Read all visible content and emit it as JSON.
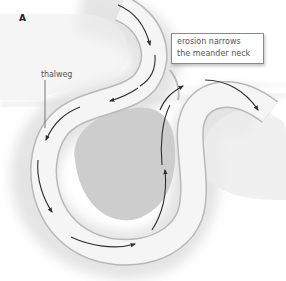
{
  "figure": {
    "panel_label": "A",
    "labels": {
      "thalweg": "thalweg"
    },
    "callout": {
      "line1": "erosion narrows",
      "line2": "the meander neck"
    },
    "colors": {
      "background": "#ffffff",
      "river_channel": "#f4f4f4",
      "river_edge": "#bdbdbd",
      "floodplain_shadow": "#d9d9d9",
      "point_bar": "#cfcfcf",
      "flow_arrow": "#333333",
      "label_text": "#555555",
      "callout_border": "#8a8a8a"
    },
    "elements": {
      "channel": "meander-channel",
      "point_bar": "point-bar-core",
      "flow_arrows": "thalweg-flow-arrows",
      "leader_line": "thalweg-leader-line"
    }
  }
}
